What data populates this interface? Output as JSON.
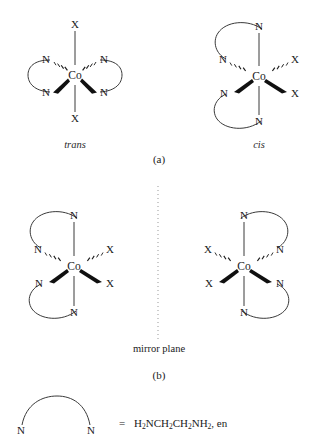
{
  "figure": {
    "title_absent": true,
    "panels": [
      {
        "id": "a",
        "label": "(a)",
        "structures": [
          {
            "name": "trans",
            "isomer_label": "trans",
            "metal": "Co",
            "axial_ligands": [
              "X",
              "X"
            ],
            "equatorial_ligands": [
              "N",
              "N",
              "N",
              "N"
            ],
            "chelate_count": 2,
            "labels": {
              "top": "X",
              "bottom": "X",
              "upper_left": "N",
              "lower_left": "N",
              "upper_right": "N",
              "lower_right": "N",
              "center": "Co"
            }
          },
          {
            "name": "cis",
            "isomer_label": "cis",
            "metal": "Co",
            "axial_ligands": [
              "N",
              "N"
            ],
            "equatorial_ligands": [
              "N",
              "N",
              "X",
              "X"
            ],
            "chelate_count": 2,
            "labels": {
              "top": "N",
              "bottom": "N",
              "upper_left": "N",
              "lower_left": "N",
              "upper_right": "X",
              "lower_right": "X",
              "center": "Co"
            }
          }
        ]
      },
      {
        "id": "b",
        "label": "(b)",
        "mirror_plane_label": "mirror plane",
        "structures": [
          {
            "name": "cis-enantiomer-left",
            "metal": "Co",
            "chelate_count": 2,
            "labels": {
              "top": "N",
              "bottom": "N",
              "upper_left": "N",
              "lower_left": "N",
              "upper_right": "X",
              "lower_right": "X",
              "center": "Co"
            }
          },
          {
            "name": "cis-enantiomer-right",
            "metal": "Co",
            "chelate_count": 2,
            "labels": {
              "top": "N",
              "bottom": "N",
              "upper_left": "X",
              "lower_left": "X",
              "upper_right": "N",
              "lower_right": "N",
              "center": "Co"
            }
          }
        ]
      }
    ],
    "legend": {
      "donor_left": "N",
      "donor_right": "N",
      "equals": "=",
      "formula_parts": [
        {
          "text": "H"
        },
        {
          "sub": "2"
        },
        {
          "text": "NCH"
        },
        {
          "sub": "2"
        },
        {
          "text": "CH"
        },
        {
          "sub": "2"
        },
        {
          "text": "NH"
        },
        {
          "sub": "2"
        },
        {
          "text": ", en"
        }
      ],
      "formula_plain": "H2NCH2CH2NH2, en",
      "abbreviation": "en"
    },
    "colors": {
      "line": "#3a3a3a",
      "wedge": "#101010",
      "text": "#1a1a1a",
      "mirror": "#999999",
      "background": "#ffffff"
    }
  }
}
